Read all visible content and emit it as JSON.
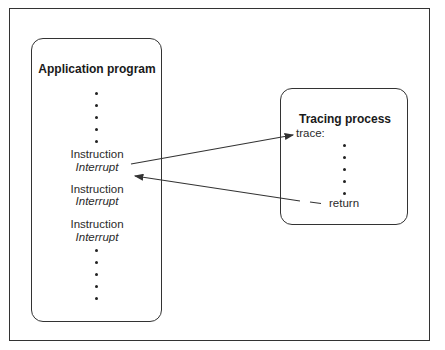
{
  "app_box": {
    "title": "Application program",
    "items": [
      {
        "instruction": "Instruction",
        "interrupt": "Interrupt"
      },
      {
        "instruction": "Instruction",
        "interrupt": "Interrupt"
      },
      {
        "instruction": "Instruction",
        "interrupt": "Interrupt"
      }
    ]
  },
  "trace_box": {
    "title": "Tracing process",
    "entry_label": "trace:",
    "exit_label": "return"
  },
  "arrows": [
    {
      "from": "app_box.items.0",
      "to": "trace_box.entry_label",
      "label": "interrupt transfer"
    },
    {
      "from": "trace_box.exit_label",
      "to": "app_box.items.0",
      "label": "return transfer"
    }
  ],
  "colors": {
    "line": "#333333",
    "text": "#1a1a1a"
  }
}
